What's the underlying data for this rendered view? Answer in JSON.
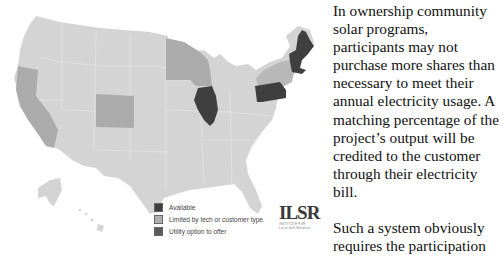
{
  "map": {
    "title": "Community solar ownership availability by state",
    "colors": {
      "base": "#d4d4d4",
      "available": "#3f3f3f",
      "limited": "#ababab",
      "utility_option": "#555555",
      "border": "#e6e6e6"
    },
    "states_available": [
      "Illinois",
      "Pennsylvania",
      "Maine",
      "Vermont",
      "New Hampshire",
      "Massachusetts"
    ],
    "states_limited": [
      "California",
      "Colorado",
      "Minnesota",
      "Wisconsin",
      "New York"
    ],
    "legend": [
      {
        "label": "Available",
        "color": "#3f3f3f"
      },
      {
        "label": "Limited by tech or customer type",
        "color": "#b0b0b0"
      },
      {
        "label": "Utility option to offer",
        "color": "#5a5a5a"
      }
    ],
    "logo": {
      "main": "ILSR",
      "sub1": "INSTITUTE FOR",
      "sub2": "Local Self-Reliance"
    }
  },
  "article": {
    "paragraph1_lines": [
      "In ownership community",
      "solar programs,",
      "participants may not",
      "purchase more shares than",
      "necessary to meet their",
      "annual electricity usage. A",
      "matching percentage of the",
      "project’s output will be",
      "credited to the customer",
      "through their electricity",
      "bill."
    ],
    "paragraph2_lines": [
      "Such a system obviously",
      "requires the participation"
    ]
  }
}
